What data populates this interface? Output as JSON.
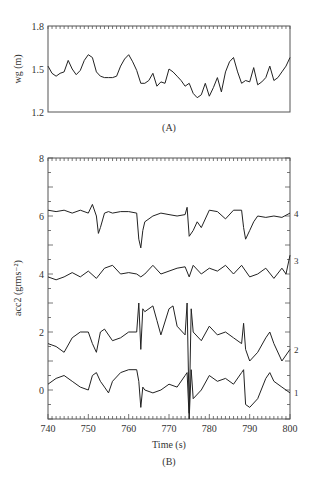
{
  "chart_data": [
    {
      "panel": "A",
      "type": "line",
      "title": "",
      "caption": "(A)",
      "xlabel": "",
      "ylabel": "wg (m)",
      "xlim": [
        740,
        800
      ],
      "ylim": [
        1.2,
        1.8
      ],
      "yticks": [
        "1.2",
        "1.5",
        "1.8"
      ],
      "grid": false,
      "series": [
        {
          "name": "wg",
          "x": [
            740,
            741,
            742,
            743,
            744,
            745,
            746,
            747,
            748,
            749,
            750,
            751,
            752,
            753,
            754,
            755,
            756,
            757,
            758,
            759,
            760,
            761,
            762,
            763,
            764,
            765,
            766,
            767,
            768,
            769,
            770,
            771,
            772,
            773,
            774,
            775,
            776,
            777,
            778,
            779,
            780,
            781,
            782,
            783,
            784,
            785,
            786,
            787,
            788,
            789,
            790,
            791,
            792,
            793,
            794,
            795,
            796,
            797,
            798,
            799,
            800
          ],
          "values": [
            1.52,
            1.47,
            1.45,
            1.47,
            1.48,
            1.56,
            1.5,
            1.46,
            1.49,
            1.56,
            1.6,
            1.58,
            1.48,
            1.45,
            1.44,
            1.44,
            1.44,
            1.45,
            1.52,
            1.57,
            1.6,
            1.55,
            1.49,
            1.4,
            1.4,
            1.42,
            1.47,
            1.38,
            1.41,
            1.4,
            1.5,
            1.48,
            1.45,
            1.42,
            1.38,
            1.4,
            1.33,
            1.3,
            1.32,
            1.4,
            1.31,
            1.37,
            1.44,
            1.34,
            1.48,
            1.55,
            1.58,
            1.48,
            1.4,
            1.42,
            1.41,
            1.51,
            1.39,
            1.41,
            1.44,
            1.52,
            1.42,
            1.44,
            1.48,
            1.52,
            1.58
          ]
        }
      ]
    },
    {
      "panel": "B",
      "type": "line",
      "title": "",
      "caption": "(B)",
      "xlabel": "Time (s)",
      "ylabel": "acc2 (grms⁻²)",
      "xlim": [
        740,
        800
      ],
      "ylim": [
        -1,
        8
      ],
      "xticks": [
        "740",
        "750",
        "760",
        "770",
        "780",
        "790",
        "800"
      ],
      "yticks": [
        "0",
        "2",
        "4",
        "6",
        "8"
      ],
      "grid": false,
      "legend_position": "right-edge labels",
      "series": [
        {
          "name": "4",
          "x": [
            740,
            742,
            744,
            746,
            748,
            750,
            751,
            752,
            752.5,
            753,
            754,
            755,
            756,
            758,
            760,
            762,
            762.5,
            763,
            763.5,
            764,
            766,
            768,
            770,
            772,
            774,
            774.5,
            775,
            776,
            777,
            778,
            780,
            782,
            784,
            786,
            788,
            788.5,
            789,
            790,
            791,
            792,
            794,
            796,
            798,
            800
          ],
          "values": [
            6.2,
            6.15,
            6.2,
            6.1,
            6.2,
            6.1,
            6.4,
            6.0,
            5.4,
            5.6,
            6.1,
            6.15,
            6.1,
            6.15,
            6.15,
            6.1,
            5.2,
            4.9,
            5.5,
            5.8,
            6.0,
            6.1,
            6.05,
            6.0,
            6.05,
            6.3,
            5.3,
            5.5,
            5.8,
            5.6,
            6.2,
            6.15,
            5.9,
            6.2,
            6.2,
            5.6,
            5.2,
            5.5,
            5.8,
            6.0,
            5.95,
            6.0,
            5.95,
            6.1
          ]
        },
        {
          "name": "3",
          "x": [
            740,
            742,
            744,
            746,
            748,
            750,
            752,
            754,
            756,
            758,
            760,
            762,
            763,
            764,
            766,
            768,
            770,
            772,
            774,
            775,
            776,
            778,
            780,
            782,
            784,
            786,
            788,
            790,
            792,
            794,
            796,
            798,
            799,
            800
          ],
          "values": [
            3.9,
            3.8,
            3.9,
            4.05,
            3.9,
            4.1,
            3.85,
            4.2,
            4.3,
            4.0,
            4.05,
            4.0,
            3.9,
            4.0,
            4.3,
            4.0,
            4.1,
            4.2,
            4.25,
            3.9,
            4.3,
            4.0,
            4.2,
            4.1,
            4.3,
            4.0,
            4.3,
            3.9,
            4.0,
            4.2,
            3.85,
            4.2,
            4.0,
            4.65
          ]
        },
        {
          "name": "2",
          "x": [
            740,
            742,
            744,
            746,
            748,
            750,
            751,
            752,
            753,
            754,
            756,
            758,
            760,
            762,
            762.5,
            763,
            763.5,
            764,
            766,
            767,
            768,
            770,
            771,
            772,
            774,
            774.5,
            775,
            775.5,
            776,
            778,
            780,
            782,
            784,
            786,
            788,
            788.5,
            789,
            790,
            792,
            794,
            795,
            796,
            798,
            800
          ],
          "values": [
            1.6,
            1.5,
            1.3,
            1.8,
            2.0,
            2.0,
            1.6,
            1.3,
            2.0,
            2.1,
            1.7,
            1.8,
            2.0,
            2.0,
            3.0,
            1.4,
            2.8,
            2.7,
            2.9,
            2.4,
            1.9,
            2.8,
            2.9,
            2.2,
            1.9,
            3.0,
            -0.8,
            2.8,
            2.0,
            1.7,
            2.2,
            1.9,
            2.0,
            1.8,
            1.6,
            2.3,
            1.4,
            1.0,
            1.3,
            1.8,
            2.0,
            1.6,
            1.0,
            1.4
          ]
        },
        {
          "name": "1",
          "x": [
            740,
            742,
            744,
            746,
            748,
            750,
            751,
            752,
            753,
            754,
            755,
            756,
            758,
            760,
            762,
            762.5,
            763,
            763.5,
            764,
            766,
            768,
            770,
            772,
            774,
            774.5,
            775,
            775.5,
            776,
            778,
            780,
            782,
            784,
            786,
            788,
            788.5,
            789,
            790,
            792,
            794,
            795,
            796,
            798,
            800
          ],
          "values": [
            0.2,
            0.4,
            0.5,
            0.3,
            0.1,
            0.0,
            0.5,
            0.6,
            0.3,
            0.1,
            -0.1,
            0.3,
            0.6,
            0.7,
            0.7,
            0.3,
            -0.6,
            0.1,
            0.0,
            -0.1,
            0.0,
            0.2,
            0.1,
            0.5,
            0.6,
            -1.0,
            0.7,
            -0.3,
            0.0,
            0.5,
            0.3,
            0.4,
            0.2,
            0.6,
            0.7,
            -0.5,
            -0.6,
            -0.3,
            0.4,
            0.6,
            0.3,
            0.1,
            -0.1
          ]
        }
      ]
    }
  ]
}
